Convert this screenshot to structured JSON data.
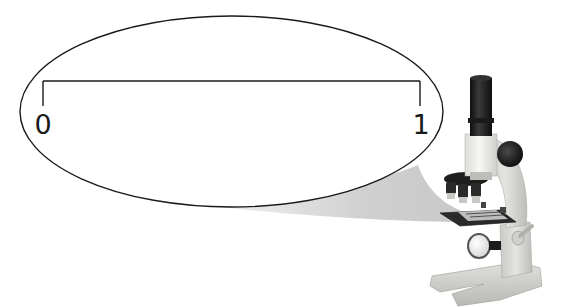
{
  "diagram": {
    "type": "magnified-number-line",
    "number_line": {
      "start_label": "0",
      "end_label": "1",
      "start_value": 0,
      "end_value": 1
    },
    "magnifier": "microscope",
    "colors": {
      "line": "#1a1a1a",
      "beam": "#d4d4d4",
      "microscope_body": "#dcdcd8",
      "microscope_dark": "#1c1c1c",
      "microscope_tube_white": "#f2f2ee"
    }
  }
}
